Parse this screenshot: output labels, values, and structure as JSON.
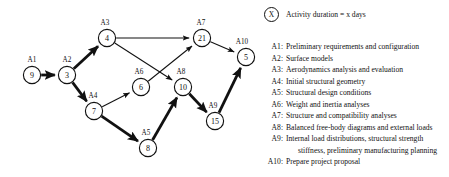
{
  "diagram": {
    "key": {
      "symbol": "X",
      "text": "Activity duration = x days"
    },
    "nodes": [
      {
        "id": "n9",
        "value": "9",
        "activity": "A1",
        "cx": 32,
        "cy": 75,
        "r": 8.6,
        "label_dx": 0,
        "label_dy": -13
      },
      {
        "id": "n3",
        "value": "3",
        "activity": "A2",
        "cx": 67,
        "cy": 75,
        "r": 8.6,
        "label_dx": 0,
        "label_dy": -13
      },
      {
        "id": "n4",
        "value": "4",
        "activity": "A3",
        "cx": 107,
        "cy": 38,
        "r": 8.6,
        "label_dx": -2,
        "label_dy": -13
      },
      {
        "id": "n21",
        "value": "21",
        "activity": "A7",
        "cx": 202,
        "cy": 38,
        "r": 8.6,
        "label_dx": -1,
        "label_dy": -13
      },
      {
        "id": "n5",
        "value": "5",
        "activity": "A10",
        "cx": 246,
        "cy": 57,
        "r": 8.6,
        "label_dx": -4,
        "label_dy": -13
      },
      {
        "id": "n6",
        "value": "6",
        "activity": "A6",
        "cx": 141,
        "cy": 87,
        "r": 8.6,
        "label_dx": -2,
        "label_dy": -13
      },
      {
        "id": "n10",
        "value": "10",
        "activity": "A8",
        "cx": 183,
        "cy": 87,
        "r": 8.6,
        "label_dx": -2,
        "label_dy": -13
      },
      {
        "id": "n7",
        "value": "7",
        "activity": "A4",
        "cx": 94,
        "cy": 111,
        "r": 8.6,
        "label_dx": -1,
        "label_dy": -13
      },
      {
        "id": "n8",
        "value": "8",
        "activity": "A5",
        "cx": 148,
        "cy": 148,
        "r": 8.6,
        "label_dx": -2,
        "label_dy": -13
      },
      {
        "id": "n15",
        "value": "15",
        "activity": "A9",
        "cx": 215,
        "cy": 121,
        "r": 8.6,
        "label_dx": -2,
        "label_dy": -13
      }
    ],
    "edges": [
      {
        "from": "n9",
        "to": "n3",
        "critical": true
      },
      {
        "from": "n3",
        "to": "n4",
        "critical": true
      },
      {
        "from": "n3",
        "to": "n7",
        "critical": true
      },
      {
        "from": "n4",
        "to": "n21",
        "critical": false
      },
      {
        "from": "n4",
        "to": "n10",
        "critical": false
      },
      {
        "from": "n7",
        "to": "n6",
        "critical": false
      },
      {
        "from": "n7",
        "to": "n8",
        "critical": true
      },
      {
        "from": "n6",
        "to": "n21",
        "critical": false
      },
      {
        "from": "n8",
        "to": "n10",
        "critical": true
      },
      {
        "from": "n10",
        "to": "n15",
        "critical": true
      },
      {
        "from": "n21",
        "to": "n5",
        "critical": false
      },
      {
        "from": "n15",
        "to": "n5",
        "critical": true
      }
    ]
  },
  "legend": {
    "items": [
      {
        "code": "A1:",
        "desc": "Preliminary requirements and configuration",
        "cont": ""
      },
      {
        "code": "A2:",
        "desc": "Surface models",
        "cont": ""
      },
      {
        "code": "A3:",
        "desc": "Aerodynamics analysis and evaluation",
        "cont": ""
      },
      {
        "code": "A4:",
        "desc": "Initial structural geometry",
        "cont": ""
      },
      {
        "code": "A5:",
        "desc": "Structural design conditions",
        "cont": ""
      },
      {
        "code": "A6:",
        "desc": "Weight and inertia analyses",
        "cont": ""
      },
      {
        "code": "A7:",
        "desc": "Structure and compatibility analyses",
        "cont": ""
      },
      {
        "code": "A8:",
        "desc": "Balanced free-body diagrams and external loads",
        "cont": ""
      },
      {
        "code": "A9:",
        "desc": "Internal load distributions, structural strength",
        "cont": "stiffness, preliminary manufacturing planning"
      },
      {
        "code": "A10:",
        "desc": "Prepare project proposal",
        "cont": ""
      }
    ]
  }
}
